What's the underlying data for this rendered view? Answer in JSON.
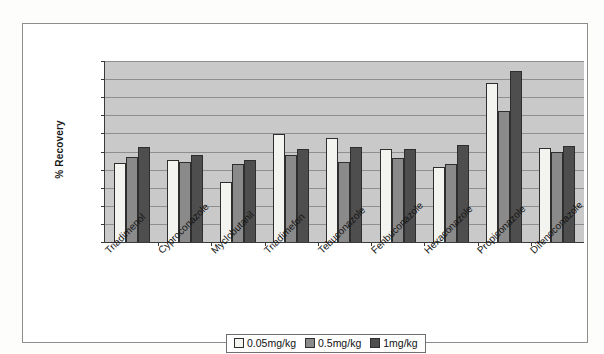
{
  "chart_data": {
    "type": "bar",
    "title": "",
    "xlabel": "",
    "ylabel": "% Recovery",
    "ylim": [
      0,
      200
    ],
    "yticks": [
      0,
      20,
      40,
      60,
      80,
      100,
      120,
      140,
      160,
      180,
      200
    ],
    "grid": true,
    "legend_position": "bottom",
    "categories": [
      "Triadimenol",
      "Cyproconazole",
      "Myclobutanil",
      "Triadimefon",
      "Tebuconazole",
      "Fenbuconazole",
      "Hexaconazole",
      "Propiconazole",
      "Difenoconazole"
    ],
    "series": [
      {
        "name": "0.05mg/kg",
        "color": "#f3f3f0",
        "values": [
          87,
          91,
          66,
          119,
          115,
          103,
          83,
          176,
          104
        ]
      },
      {
        "name": "0.5mg/kg",
        "color": "#8a8a8a",
        "values": [
          94,
          88,
          86,
          96,
          88,
          93,
          86,
          145,
          99
        ]
      },
      {
        "name": "1mg/kg",
        "color": "#4e4e4e",
        "values": [
          105,
          96,
          91,
          103,
          105,
          103,
          107,
          189,
          106
        ]
      }
    ]
  },
  "legend": {
    "items": [
      {
        "label": "0.05mg/kg"
      },
      {
        "label": "0.5mg/kg"
      },
      {
        "label": "1mg/kg"
      }
    ]
  }
}
